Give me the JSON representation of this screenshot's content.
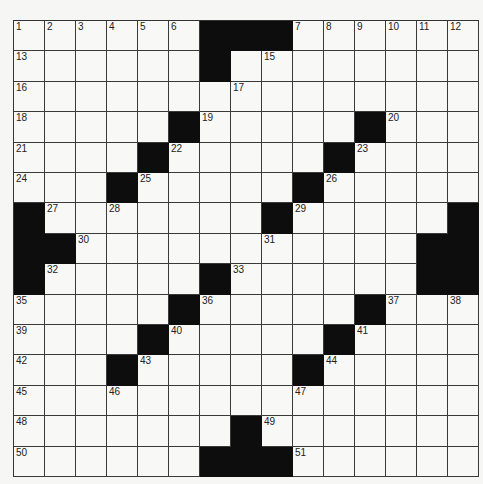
{
  "puzzle": {
    "rows": 15,
    "cols": 15,
    "colors": {
      "block": "#0d0d0d",
      "cell": "#f8f8f6",
      "line": "#3a3a3a",
      "number": "#222222"
    },
    "grid": [
      "......###......",
      "......#........",
      "...............",
      ".....#.....#...",
      "....#.....#....",
      "...#.....#.....",
      "#.......#.....#",
      "##...........##",
      "#.....#......##",
      ".....#.....#...",
      "....#.....#....",
      "...#.....#.....",
      "...............",
      ".......#.......",
      "......###......"
    ],
    "numbers": [
      {
        "r": 0,
        "c": 0,
        "n": "1"
      },
      {
        "r": 0,
        "c": 1,
        "n": "2"
      },
      {
        "r": 0,
        "c": 2,
        "n": "3"
      },
      {
        "r": 0,
        "c": 3,
        "n": "4"
      },
      {
        "r": 0,
        "c": 4,
        "n": "5"
      },
      {
        "r": 0,
        "c": 5,
        "n": "6"
      },
      {
        "r": 0,
        "c": 9,
        "n": "7"
      },
      {
        "r": 0,
        "c": 10,
        "n": "8"
      },
      {
        "r": 0,
        "c": 11,
        "n": "9"
      },
      {
        "r": 0,
        "c": 12,
        "n": "10"
      },
      {
        "r": 0,
        "c": 13,
        "n": "11"
      },
      {
        "r": 0,
        "c": 14,
        "n": "12"
      },
      {
        "r": 1,
        "c": 0,
        "n": "13"
      },
      {
        "r": 1,
        "c": 6,
        "n": "14"
      },
      {
        "r": 1,
        "c": 8,
        "n": "15"
      },
      {
        "r": 2,
        "c": 0,
        "n": "16"
      },
      {
        "r": 2,
        "c": 7,
        "n": "17"
      },
      {
        "r": 3,
        "c": 0,
        "n": "18"
      },
      {
        "r": 3,
        "c": 6,
        "n": "19"
      },
      {
        "r": 3,
        "c": 12,
        "n": "20"
      },
      {
        "r": 4,
        "c": 0,
        "n": "21"
      },
      {
        "r": 4,
        "c": 5,
        "n": "22"
      },
      {
        "r": 4,
        "c": 11,
        "n": "23"
      },
      {
        "r": 5,
        "c": 0,
        "n": "24"
      },
      {
        "r": 5,
        "c": 4,
        "n": "25"
      },
      {
        "r": 5,
        "c": 10,
        "n": "26"
      },
      {
        "r": 6,
        "c": 1,
        "n": "27"
      },
      {
        "r": 6,
        "c": 3,
        "n": "28"
      },
      {
        "r": 6,
        "c": 9,
        "n": "29"
      },
      {
        "r": 7,
        "c": 2,
        "n": "30"
      },
      {
        "r": 7,
        "c": 8,
        "n": "31"
      },
      {
        "r": 8,
        "c": 1,
        "n": "32"
      },
      {
        "r": 8,
        "c": 7,
        "n": "33"
      },
      {
        "r": 8,
        "c": 13,
        "n": "34"
      },
      {
        "r": 9,
        "c": 0,
        "n": "35"
      },
      {
        "r": 9,
        "c": 6,
        "n": "36"
      },
      {
        "r": 9,
        "c": 12,
        "n": "37"
      },
      {
        "r": 9,
        "c": 14,
        "n": "38"
      },
      {
        "r": 10,
        "c": 0,
        "n": "39"
      },
      {
        "r": 10,
        "c": 5,
        "n": "40"
      },
      {
        "r": 10,
        "c": 11,
        "n": "41"
      },
      {
        "r": 11,
        "c": 0,
        "n": "42"
      },
      {
        "r": 11,
        "c": 4,
        "n": "43"
      },
      {
        "r": 11,
        "c": 10,
        "n": "44"
      },
      {
        "r": 12,
        "c": 0,
        "n": "45"
      },
      {
        "r": 12,
        "c": 3,
        "n": "46"
      },
      {
        "r": 12,
        "c": 9,
        "n": "47"
      },
      {
        "r": 13,
        "c": 0,
        "n": "48"
      },
      {
        "r": 13,
        "c": 8,
        "n": "49"
      },
      {
        "r": 14,
        "c": 0,
        "n": "50"
      },
      {
        "r": 14,
        "c": 9,
        "n": "51"
      }
    ]
  }
}
